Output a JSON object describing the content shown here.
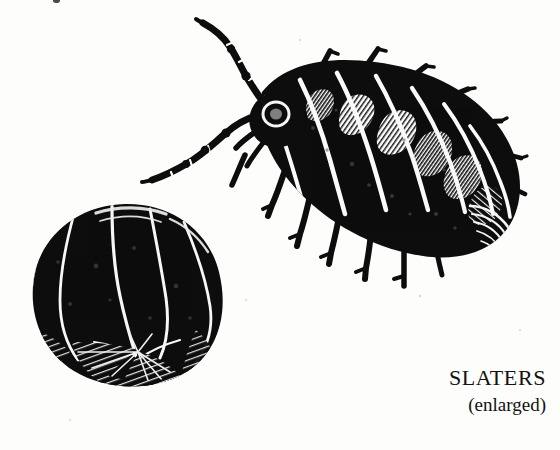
{
  "page": {
    "width": 560,
    "height": 450,
    "background_color": "#fdfdfc",
    "ink_color": "#0d0d0d",
    "medium": "black-and-white scanned line engraving"
  },
  "caption": {
    "title": "SLATERS",
    "subtitle": "(enlarged)"
  },
  "figures": [
    {
      "name": "slater-walking",
      "description": "woodlouse viewed from above, extended, walking, head at upper left and tail at lower right",
      "segment_count": 7,
      "antennae": 2,
      "legs_visible": 7
    },
    {
      "name": "slater-rolled",
      "description": "woodlouse rolled into a defensive ball, near-solid black sphere with curved white segment seams converging at lower centre",
      "segment_seams": 6
    }
  ],
  "artifacts": {
    "scan_mark_top": "small dark speck at top edge"
  }
}
